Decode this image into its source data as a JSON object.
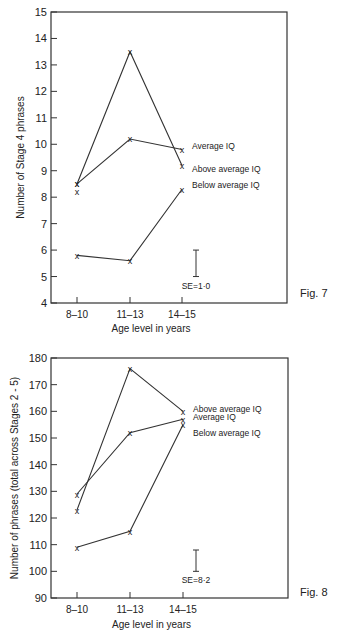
{
  "chart_data": [
    {
      "type": "line",
      "figure_label": "Fig. 7",
      "title": "",
      "xlabel": "Age level in years",
      "ylabel": "Number of Stage 4 phrases",
      "categories": [
        "8-10",
        "11-13",
        "14-15"
      ],
      "ylim": [
        4,
        15
      ],
      "yticks": [
        4,
        5,
        6,
        7,
        8,
        9,
        10,
        11,
        12,
        13,
        14,
        15
      ],
      "grid": false,
      "legend_position": "inline labels at right of last points",
      "series": [
        {
          "name": "Above average IQ",
          "values": [
            8.5,
            13.5,
            9.2
          ]
        },
        {
          "name": "Average IQ",
          "values": [
            8.5,
            10.2,
            9.8
          ]
        },
        {
          "name": "Below average IQ",
          "values": [
            5.8,
            5.6,
            8.3
          ]
        }
      ],
      "extra_points": [
        {
          "category": "8-10",
          "value": 8.2
        }
      ],
      "annotations": [
        "SE = 1.0"
      ],
      "se_bar": {
        "from": 5.0,
        "to": 6.0
      },
      "labels_text": {
        "se": "SE=1·0"
      }
    },
    {
      "type": "line",
      "figure_label": "Fig. 8",
      "title": "",
      "xlabel": "Age level in years",
      "ylabel": "Number of phrases (total across Stages 2 - 5)",
      "categories": [
        "8-10",
        "11-13",
        "14-15"
      ],
      "ylim": [
        90,
        180
      ],
      "yticks": [
        90,
        100,
        110,
        120,
        130,
        140,
        150,
        160,
        170,
        180
      ],
      "grid": false,
      "legend_position": "inline labels at right of last points",
      "series": [
        {
          "name": "Above average IQ",
          "values": [
            123,
            176,
            160
          ]
        },
        {
          "name": "Average IQ",
          "values": [
            129,
            152,
            157
          ]
        },
        {
          "name": "Below average IQ",
          "values": [
            109,
            115,
            155
          ]
        }
      ],
      "annotations": [
        "SE = 8.2"
      ],
      "se_bar": {
        "from": 100,
        "to": 108
      },
      "labels_text": {
        "se": "SE=8·2"
      }
    }
  ]
}
